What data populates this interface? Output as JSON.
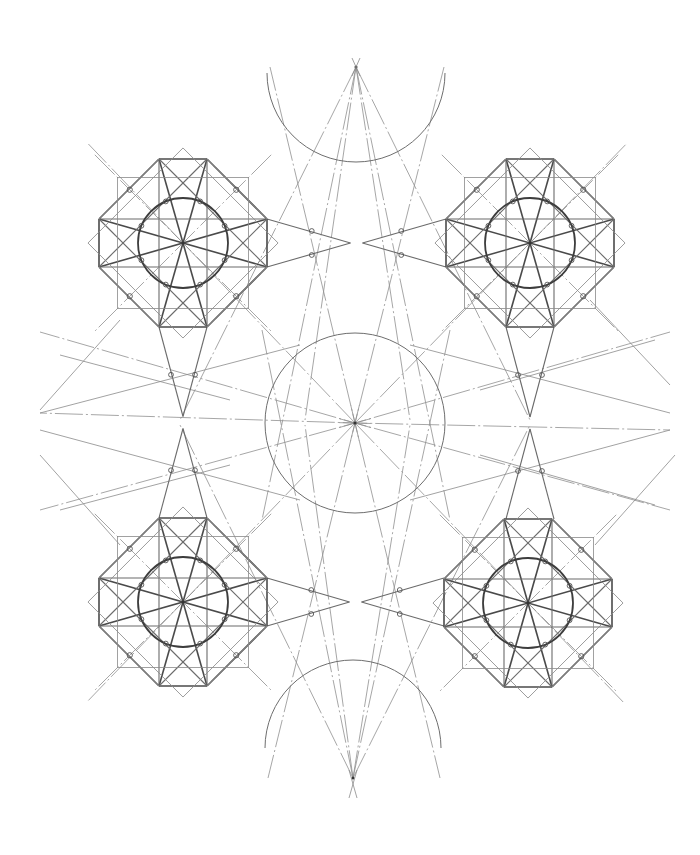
{
  "drawing": {
    "title": "",
    "kind": "geometric construction",
    "pattern": "eight-pointed star tessellation construction",
    "colors": {
      "background": "#ffffff",
      "construction_line": "#8a8a8a",
      "guide_line": "#6b6b6b",
      "star_line": "#4a4a4a",
      "circle": "#6e6e6e",
      "node": "#555555"
    },
    "hub": {
      "name": "central-hub",
      "ray_count": 12
    },
    "arcs": [
      {
        "name": "top-arc"
      },
      {
        "name": "bottom-arc"
      }
    ],
    "apexes": [
      {
        "name": "top-apex"
      },
      {
        "name": "bottom-apex"
      }
    ],
    "stars": [
      {
        "name": "star-top-left",
        "points": 8
      },
      {
        "name": "star-top-right",
        "points": 8
      },
      {
        "name": "star-bottom-left",
        "points": 8
      },
      {
        "name": "star-bottom-right",
        "points": 8
      }
    ],
    "connectors": [
      {
        "name": "connector-top"
      },
      {
        "name": "connector-bottom"
      },
      {
        "name": "connector-left"
      },
      {
        "name": "connector-right"
      }
    ]
  }
}
